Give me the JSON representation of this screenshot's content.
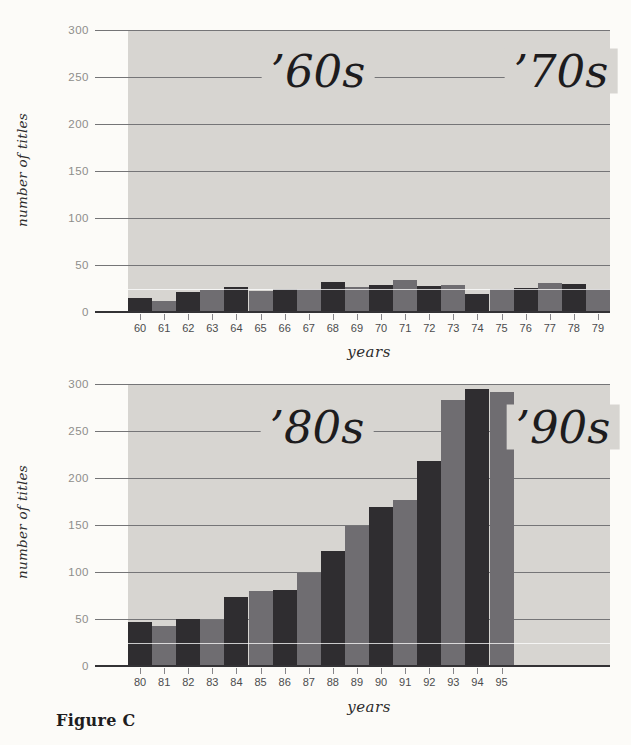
{
  "page": {
    "figure_label": "Figure C"
  },
  "colors": {
    "page_bg": "#fcfbf8",
    "plot_bg": "#d7d5d1",
    "gridline": "#757577",
    "baseline": "#333235",
    "minor_line": "#ffffff",
    "dark_bar": "#2f2d30",
    "light_bar": "#6f6d71",
    "y_label_text": "#8e8d8b",
    "x_label_text": "#4b4b4d",
    "decade_text": "#1d1c1e"
  },
  "charts": [
    {
      "name": "titles-per-year-1960s-1970s",
      "ylabel": "number of titles",
      "xlabel": "years",
      "decade_labels": [
        "’60s",
        "’70s"
      ],
      "chart_data": {
        "type": "bar",
        "categories": [
          "60",
          "61",
          "62",
          "63",
          "64",
          "65",
          "66",
          "67",
          "68",
          "69",
          "70",
          "71",
          "72",
          "73",
          "74",
          "75",
          "76",
          "77",
          "78",
          "79"
        ],
        "values": [
          15,
          12,
          21,
          23,
          27,
          22,
          24,
          25,
          32,
          27,
          29,
          34,
          28,
          29,
          19,
          25,
          26,
          31,
          30,
          25
        ],
        "title": "",
        "xlabel": "years",
        "ylabel": "number of titles",
        "ylim": [
          0,
          300
        ],
        "yticks": [
          0,
          50,
          100,
          150,
          200,
          250,
          300
        ],
        "minor_line_value": 25,
        "bar_color_pattern": [
          "#2f2d30",
          "#6f6d71"
        ],
        "annotations": [
          "’60s",
          "’70s"
        ],
        "grid": true,
        "legend": false
      }
    },
    {
      "name": "titles-per-year-1980s-1990s",
      "ylabel": "number of titles",
      "xlabel": "years",
      "decade_labels": [
        "’80s",
        "’90s"
      ],
      "chart_data": {
        "type": "bar",
        "categories": [
          "80",
          "81",
          "82",
          "83",
          "84",
          "85",
          "86",
          "87",
          "88",
          "89",
          "90",
          "91",
          "92",
          "93",
          "94",
          "95"
        ],
        "values": [
          47,
          43,
          50,
          49,
          73,
          80,
          81,
          99,
          122,
          149,
          169,
          177,
          218,
          283,
          295,
          291
        ],
        "title": "",
        "xlabel": "years",
        "ylabel": "number of titles",
        "ylim": [
          0,
          300
        ],
        "yticks": [
          0,
          50,
          100,
          150,
          200,
          250,
          300
        ],
        "minor_line_value": 25,
        "bar_color_pattern": [
          "#2f2d30",
          "#6f6d71"
        ],
        "annotations": [
          "’80s",
          "’90s"
        ],
        "grid": true,
        "legend": false
      }
    }
  ]
}
